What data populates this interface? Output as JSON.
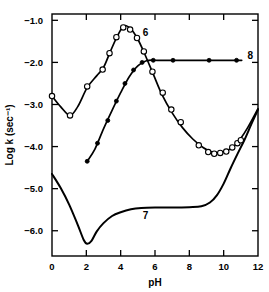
{
  "chart_data": {
    "type": "line",
    "title": "",
    "xlabel": "pH",
    "ylabel": "Log k (sec⁻¹)",
    "xlim": [
      0,
      12
    ],
    "ylim": [
      -6.6,
      -0.85
    ],
    "grid": false,
    "legend": "inline-curve-labels",
    "xticks": [
      0,
      2,
      4,
      6,
      8,
      10,
      12
    ],
    "xtick_labels": [
      "0",
      "2",
      "4",
      "6",
      "8",
      "10",
      "12"
    ],
    "yticks": [
      -1.0,
      -2.0,
      -3.0,
      -4.0,
      -5.0,
      -6.0
    ],
    "ytick_labels": [
      "−1.0",
      "−2.0",
      "−3.0",
      "−4.0",
      "−5.0",
      "−6.0"
    ],
    "series": [
      {
        "name": "6",
        "label": "6",
        "marker": "open-circle",
        "marker_color": "#ffffff",
        "line_color": "#000000",
        "label_x": 5.45,
        "label_y": -1.38,
        "points": [
          {
            "x": 0.0,
            "y": -2.8
          },
          {
            "x": 1.05,
            "y": -3.26
          },
          {
            "x": 2.05,
            "y": -2.57
          },
          {
            "x": 2.95,
            "y": -2.17
          },
          {
            "x": 3.35,
            "y": -1.78
          },
          {
            "x": 3.75,
            "y": -1.4
          },
          {
            "x": 4.15,
            "y": -1.17
          },
          {
            "x": 4.55,
            "y": -1.22
          },
          {
            "x": 4.95,
            "y": -1.42
          },
          {
            "x": 5.35,
            "y": -1.74
          },
          {
            "x": 5.85,
            "y": -2.22
          },
          {
            "x": 6.45,
            "y": -2.72
          },
          {
            "x": 6.95,
            "y": -3.12
          },
          {
            "x": 7.5,
            "y": -3.42
          },
          {
            "x": 8.55,
            "y": -3.97
          },
          {
            "x": 9.1,
            "y": -4.13
          },
          {
            "x": 9.45,
            "y": -4.17
          },
          {
            "x": 9.8,
            "y": -4.15
          },
          {
            "x": 10.15,
            "y": -4.12
          },
          {
            "x": 10.5,
            "y": -4.02
          },
          {
            "x": 10.8,
            "y": -3.92
          },
          {
            "x": 11.0,
            "y": -3.85
          }
        ],
        "curve": [
          {
            "x": 0.0,
            "y": -2.8
          },
          {
            "x": 0.5,
            "y": -3.05
          },
          {
            "x": 1.05,
            "y": -3.26
          },
          {
            "x": 1.5,
            "y": -3.05
          },
          {
            "x": 2.05,
            "y": -2.6
          },
          {
            "x": 2.6,
            "y": -2.32
          },
          {
            "x": 3.0,
            "y": -2.12
          },
          {
            "x": 3.4,
            "y": -1.74
          },
          {
            "x": 3.8,
            "y": -1.38
          },
          {
            "x": 4.2,
            "y": -1.13
          },
          {
            "x": 4.6,
            "y": -1.21
          },
          {
            "x": 5.0,
            "y": -1.45
          },
          {
            "x": 5.4,
            "y": -1.8
          },
          {
            "x": 5.9,
            "y": -2.28
          },
          {
            "x": 6.4,
            "y": -2.76
          },
          {
            "x": 7.0,
            "y": -3.2
          },
          {
            "x": 7.6,
            "y": -3.55
          },
          {
            "x": 8.2,
            "y": -3.82
          },
          {
            "x": 8.8,
            "y": -4.02
          },
          {
            "x": 9.4,
            "y": -4.14
          },
          {
            "x": 10.0,
            "y": -4.13
          },
          {
            "x": 10.6,
            "y": -3.99
          },
          {
            "x": 11.0,
            "y": -3.8
          },
          {
            "x": 11.4,
            "y": -3.55
          },
          {
            "x": 12.0,
            "y": -3.1
          }
        ]
      },
      {
        "name": "7",
        "label": "7",
        "marker": "none",
        "line_color": "#000000",
        "label_x": 5.45,
        "label_y": -5.72,
        "points": [],
        "curve": [
          {
            "x": 0.0,
            "y": -4.65
          },
          {
            "x": 0.5,
            "y": -4.98
          },
          {
            "x": 1.0,
            "y": -5.38
          },
          {
            "x": 1.5,
            "y": -5.86
          },
          {
            "x": 1.85,
            "y": -6.22
          },
          {
            "x": 2.05,
            "y": -6.31
          },
          {
            "x": 2.3,
            "y": -6.24
          },
          {
            "x": 2.6,
            "y": -6.02
          },
          {
            "x": 3.0,
            "y": -5.82
          },
          {
            "x": 3.5,
            "y": -5.65
          },
          {
            "x": 4.0,
            "y": -5.56
          },
          {
            "x": 4.6,
            "y": -5.49
          },
          {
            "x": 5.2,
            "y": -5.46
          },
          {
            "x": 6.0,
            "y": -5.45
          },
          {
            "x": 7.0,
            "y": -5.45
          },
          {
            "x": 8.0,
            "y": -5.44
          },
          {
            "x": 8.7,
            "y": -5.42
          },
          {
            "x": 9.2,
            "y": -5.33
          },
          {
            "x": 9.6,
            "y": -5.16
          },
          {
            "x": 10.0,
            "y": -4.88
          },
          {
            "x": 10.4,
            "y": -4.52
          },
          {
            "x": 10.8,
            "y": -4.18
          },
          {
            "x": 11.2,
            "y": -3.85
          },
          {
            "x": 11.6,
            "y": -3.48
          },
          {
            "x": 12.0,
            "y": -3.12
          }
        ]
      },
      {
        "name": "8",
        "label": "8",
        "marker": "filled-circle",
        "marker_color": "#000000",
        "line_color": "#000000",
        "label_x": 11.55,
        "label_y": -1.92,
        "points": [
          {
            "x": 2.05,
            "y": -4.35
          },
          {
            "x": 2.65,
            "y": -3.92
          },
          {
            "x": 3.25,
            "y": -3.38
          },
          {
            "x": 3.75,
            "y": -2.92
          },
          {
            "x": 4.25,
            "y": -2.5
          },
          {
            "x": 4.75,
            "y": -2.18
          },
          {
            "x": 5.25,
            "y": -2.0
          },
          {
            "x": 5.9,
            "y": -1.95
          },
          {
            "x": 7.05,
            "y": -1.95
          },
          {
            "x": 9.15,
            "y": -1.95
          },
          {
            "x": 10.75,
            "y": -1.95
          }
        ],
        "curve": [
          {
            "x": 2.05,
            "y": -4.35
          },
          {
            "x": 2.5,
            "y": -4.06
          },
          {
            "x": 3.0,
            "y": -3.58
          },
          {
            "x": 3.5,
            "y": -3.14
          },
          {
            "x": 4.0,
            "y": -2.72
          },
          {
            "x": 4.5,
            "y": -2.34
          },
          {
            "x": 5.0,
            "y": -2.08
          },
          {
            "x": 5.5,
            "y": -1.96
          },
          {
            "x": 6.2,
            "y": -1.95
          },
          {
            "x": 8.0,
            "y": -1.95
          },
          {
            "x": 10.0,
            "y": -1.95
          },
          {
            "x": 11.05,
            "y": -1.95
          }
        ]
      }
    ]
  },
  "axes": {
    "x_axis_name": "pH",
    "y_axis_name": "Log k (sec⁻¹)"
  }
}
